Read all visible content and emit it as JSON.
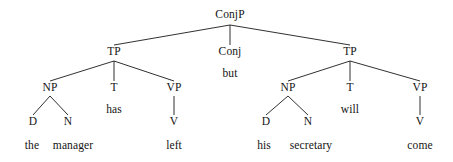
{
  "figure": {
    "type": "syntax-tree",
    "sentence": "the manager has left but his secretary will come",
    "background_color": "#ffffff",
    "line_color": "#1a1a1a",
    "text_color": "#141414"
  },
  "nodes": [
    {
      "id": "conjp",
      "label": "ConjP",
      "kind": "category",
      "x": 230,
      "y": 15
    },
    {
      "id": "tp-left",
      "label": "TP",
      "kind": "category",
      "x": 114,
      "y": 52
    },
    {
      "id": "conj",
      "label": "Conj",
      "kind": "category",
      "x": 230,
      "y": 52
    },
    {
      "id": "tp-right",
      "label": "TP",
      "kind": "category",
      "x": 350,
      "y": 52
    },
    {
      "id": "conj-word",
      "label": "but",
      "kind": "word",
      "x": 230,
      "y": 74
    },
    {
      "id": "np-left",
      "label": "NP",
      "kind": "category",
      "x": 50,
      "y": 88
    },
    {
      "id": "t-left",
      "label": "T",
      "kind": "category",
      "x": 114,
      "y": 88
    },
    {
      "id": "vp-left",
      "label": "VP",
      "kind": "category",
      "x": 174,
      "y": 88
    },
    {
      "id": "np-right",
      "label": "NP",
      "kind": "category",
      "x": 288,
      "y": 88
    },
    {
      "id": "t-right",
      "label": "T",
      "kind": "category",
      "x": 350,
      "y": 88
    },
    {
      "id": "vp-right",
      "label": "VP",
      "kind": "category",
      "x": 420,
      "y": 88
    },
    {
      "id": "t-left-word",
      "label": "has",
      "kind": "word",
      "x": 114,
      "y": 110
    },
    {
      "id": "t-right-word",
      "label": "will",
      "kind": "word",
      "x": 350,
      "y": 110
    },
    {
      "id": "d-left",
      "label": "D",
      "kind": "category",
      "x": 33,
      "y": 122
    },
    {
      "id": "n-left",
      "label": "N",
      "kind": "category",
      "x": 68,
      "y": 122
    },
    {
      "id": "v-left",
      "label": "V",
      "kind": "category",
      "x": 174,
      "y": 122
    },
    {
      "id": "d-right",
      "label": "D",
      "kind": "category",
      "x": 266,
      "y": 122
    },
    {
      "id": "n-right",
      "label": "N",
      "kind": "category",
      "x": 308,
      "y": 122
    },
    {
      "id": "v-right",
      "label": "V",
      "kind": "category",
      "x": 420,
      "y": 122
    },
    {
      "id": "word-the",
      "label": "the",
      "kind": "word",
      "x": 32,
      "y": 146
    },
    {
      "id": "word-manager",
      "label": "manager",
      "kind": "word",
      "x": 73,
      "y": 146
    },
    {
      "id": "word-left",
      "label": "left",
      "kind": "word",
      "x": 174,
      "y": 146
    },
    {
      "id": "word-his",
      "label": "his",
      "kind": "word",
      "x": 264,
      "y": 146
    },
    {
      "id": "word-secretary",
      "label": "secretary",
      "kind": "word",
      "x": 311,
      "y": 146
    },
    {
      "id": "word-come",
      "label": "come",
      "kind": "word",
      "x": 420,
      "y": 146
    }
  ],
  "edges": [
    {
      "from": "conjp",
      "to": "tp-left",
      "x1": 230,
      "y1": 25,
      "x2": 114,
      "y2": 45
    },
    {
      "from": "conjp",
      "to": "conj",
      "x1": 230,
      "y1": 25,
      "x2": 230,
      "y2": 45
    },
    {
      "from": "conjp",
      "to": "tp-right",
      "x1": 230,
      "y1": 25,
      "x2": 350,
      "y2": 45
    },
    {
      "from": "tp-left",
      "to": "np-left",
      "x1": 114,
      "y1": 61,
      "x2": 50,
      "y2": 81
    },
    {
      "from": "tp-left",
      "to": "t-left",
      "x1": 114,
      "y1": 61,
      "x2": 114,
      "y2": 81
    },
    {
      "from": "tp-left",
      "to": "vp-left",
      "x1": 114,
      "y1": 61,
      "x2": 174,
      "y2": 81
    },
    {
      "from": "tp-right",
      "to": "np-right",
      "x1": 350,
      "y1": 61,
      "x2": 288,
      "y2": 81
    },
    {
      "from": "tp-right",
      "to": "t-right",
      "x1": 350,
      "y1": 61,
      "x2": 350,
      "y2": 81
    },
    {
      "from": "tp-right",
      "to": "vp-right",
      "x1": 350,
      "y1": 61,
      "x2": 420,
      "y2": 81
    },
    {
      "from": "np-left",
      "to": "d-left",
      "x1": 50,
      "y1": 96,
      "x2": 33,
      "y2": 115
    },
    {
      "from": "np-left",
      "to": "n-left",
      "x1": 50,
      "y1": 96,
      "x2": 68,
      "y2": 115
    },
    {
      "from": "vp-left",
      "to": "v-left",
      "x1": 174,
      "y1": 96,
      "x2": 174,
      "y2": 115
    },
    {
      "from": "np-right",
      "to": "d-right",
      "x1": 288,
      "y1": 96,
      "x2": 266,
      "y2": 115
    },
    {
      "from": "np-right",
      "to": "n-right",
      "x1": 288,
      "y1": 96,
      "x2": 308,
      "y2": 115
    },
    {
      "from": "vp-right",
      "to": "v-right",
      "x1": 420,
      "y1": 96,
      "x2": 420,
      "y2": 115
    }
  ]
}
